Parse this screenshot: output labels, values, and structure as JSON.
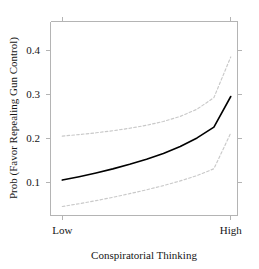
{
  "chart_data": {
    "type": "line",
    "title": "",
    "xlabel": "Conspiratorial Thinking",
    "ylabel": "Prob (Favor Repealing Gun Control)",
    "xtick_labels": [
      "Low",
      "High"
    ],
    "xtick_values": [
      0,
      1
    ],
    "ytick_labels": [
      "0.1",
      "0.2",
      "0.3",
      "0.4"
    ],
    "ytick_values": [
      0.1,
      0.2,
      0.3,
      0.4
    ],
    "xlim": [
      -0.07,
      1.04
    ],
    "ylim": [
      0.0245,
      0.4655
    ],
    "grid": false,
    "legend": "none",
    "frame": "box",
    "x": [
      0,
      0.1,
      0.2,
      0.3,
      0.4,
      0.5,
      0.6,
      0.7,
      0.8,
      0.9,
      1
    ],
    "series": [
      {
        "name": "Predicted probability",
        "style": "solid",
        "color": "#000000",
        "values": [
          0.105,
          0.1127,
          0.1212,
          0.1305,
          0.1408,
          0.1522,
          0.1654,
          0.1812,
          0.2008,
          0.2254,
          0.295
        ]
      },
      {
        "name": "Upper 95% confidence bound",
        "style": "dashed",
        "color": "#c9c9c9",
        "values": [
          0.205,
          0.2085,
          0.2125,
          0.2172,
          0.2228,
          0.2296,
          0.2382,
          0.2497,
          0.2662,
          0.2925,
          0.385
        ]
      },
      {
        "name": "Lower 95% confidence bound",
        "style": "dashed",
        "color": "#c9c9c9",
        "values": [
          0.045,
          0.0513,
          0.0583,
          0.0659,
          0.0741,
          0.0829,
          0.0925,
          0.1031,
          0.1153,
          0.1308,
          0.212
        ]
      }
    ]
  },
  "axes": {
    "x_title": "Conspiratorial Thinking",
    "y_title": "Prob (Favor Repealing Gun Control)",
    "xticks": [
      "Low",
      "High"
    ],
    "yticks": [
      "0.1",
      "0.2",
      "0.3",
      "0.4"
    ]
  }
}
